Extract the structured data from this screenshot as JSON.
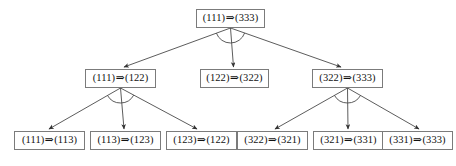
{
  "diagram": {
    "type": "derivation-tree",
    "title": "",
    "background_color": "#ffffff",
    "box_border_color": "#7b7b7b",
    "edge_color": "#4a4a4a",
    "text_color": "#111111",
    "arrow_glyph": "⇒",
    "levels": 3,
    "nodes": [
      {
        "id": "root",
        "level": 0,
        "lhs": "(111)",
        "arrow": "⇒",
        "rhs": "(333)",
        "label": "(111)⇒(333)",
        "x": 196,
        "y": 9,
        "w": 69,
        "h": 19
      },
      {
        "id": "n-l",
        "level": 1,
        "lhs": "(111)",
        "arrow": "⇒",
        "rhs": "(122)",
        "label": "(111)⇒(122)",
        "x": 85,
        "y": 69,
        "w": 71,
        "h": 19
      },
      {
        "id": "n-m",
        "level": 1,
        "lhs": "(122)",
        "arrow": "⇒",
        "rhs": "(322)",
        "label": "(122)⇒(322)",
        "x": 200,
        "y": 69,
        "w": 69,
        "h": 19
      },
      {
        "id": "n-r",
        "level": 1,
        "lhs": "(322)",
        "arrow": "⇒",
        "rhs": "(333)",
        "label": "(322)⇒(333)",
        "x": 312,
        "y": 69,
        "w": 71,
        "h": 19
      },
      {
        "id": "leaf-1",
        "level": 2,
        "lhs": "(111)",
        "arrow": "⇒",
        "rhs": "(113)",
        "label": "(111)⇒(113)",
        "x": 14,
        "y": 131,
        "w": 71,
        "h": 19
      },
      {
        "id": "leaf-2",
        "level": 2,
        "lhs": "(113)",
        "arrow": "⇒",
        "rhs": "(123)",
        "label": "(113)⇒(123)",
        "x": 90,
        "y": 131,
        "w": 71,
        "h": 19
      },
      {
        "id": "leaf-3",
        "level": 2,
        "lhs": "(123)",
        "arrow": "⇒",
        "rhs": "(122)",
        "label": "(123)⇒(122)",
        "x": 166,
        "y": 131,
        "w": 71,
        "h": 19
      },
      {
        "id": "leaf-4",
        "level": 2,
        "lhs": "(322)",
        "arrow": "⇒",
        "rhs": "(321)",
        "label": "(322)⇒(321)",
        "x": 237,
        "y": 131,
        "w": 71,
        "h": 19
      },
      {
        "id": "leaf-5",
        "level": 2,
        "lhs": "(321)",
        "arrow": "⇒",
        "rhs": "(331)",
        "label": "(321)⇒(331)",
        "x": 313,
        "y": 131,
        "w": 71,
        "h": 19
      },
      {
        "id": "leaf-6",
        "level": 2,
        "lhs": "(331)",
        "arrow": "⇒",
        "rhs": "(333)",
        "label": "(331)⇒(333)",
        "x": 382,
        "y": 131,
        "w": 71,
        "h": 19
      }
    ],
    "edges": [
      {
        "id": "e-root-l",
        "from": "root",
        "to": "n-l",
        "x1": 230.5,
        "y1": 28,
        "x2": 124,
        "y2": 67
      },
      {
        "id": "e-root-m",
        "from": "root",
        "to": "n-m",
        "x1": 230.5,
        "y1": 28,
        "x2": 233.5,
        "y2": 67
      },
      {
        "id": "e-root-r",
        "from": "root",
        "to": "n-r",
        "x1": 230.5,
        "y1": 28,
        "x2": 341,
        "y2": 67
      },
      {
        "id": "e-l-1",
        "from": "n-l",
        "to": "leaf-1",
        "x1": 120.5,
        "y1": 88,
        "x2": 49,
        "y2": 129
      },
      {
        "id": "e-l-2",
        "from": "n-l",
        "to": "leaf-2",
        "x1": 120.5,
        "y1": 88,
        "x2": 124,
        "y2": 129
      },
      {
        "id": "e-l-3",
        "from": "n-l",
        "to": "leaf-3",
        "x1": 120.5,
        "y1": 88,
        "x2": 197,
        "y2": 129
      },
      {
        "id": "e-r-4",
        "from": "n-r",
        "to": "leaf-4",
        "x1": 347.5,
        "y1": 88,
        "x2": 275,
        "y2": 129
      },
      {
        "id": "e-r-5",
        "from": "n-r",
        "to": "leaf-5",
        "x1": 347.5,
        "y1": 88,
        "x2": 348,
        "y2": 129
      },
      {
        "id": "e-r-6",
        "from": "n-r",
        "to": "leaf-6",
        "x1": 347.5,
        "y1": 88,
        "x2": 419,
        "y2": 129
      }
    ],
    "angle_arcs": [
      {
        "id": "arc-root",
        "at": "root",
        "cx": 230.5,
        "cy": 28,
        "radius": 15
      },
      {
        "id": "arc-left",
        "at": "n-l",
        "cx": 120.5,
        "cy": 88,
        "radius": 15
      },
      {
        "id": "arc-right",
        "at": "n-r",
        "cx": 347.5,
        "cy": 88,
        "radius": 15
      }
    ]
  }
}
